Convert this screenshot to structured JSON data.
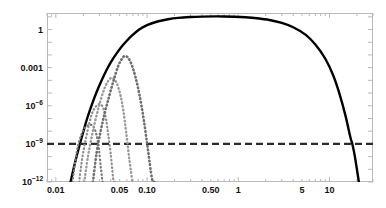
{
  "chart_data": {
    "type": "line",
    "title": "",
    "xlabel": "",
    "ylabel": "",
    "xscale": "log",
    "yscale": "log",
    "xlim": [
      0.008,
      30
    ],
    "ylim": [
      1e-12,
      20
    ],
    "grid": false,
    "legend": null,
    "xticks": [
      {
        "value": 0.01,
        "label": "0.01"
      },
      {
        "value": 0.05,
        "label": "0.05"
      },
      {
        "value": 0.1,
        "label": "0.10"
      },
      {
        "value": 0.5,
        "label": "0.50"
      },
      {
        "value": 1,
        "label": "1"
      },
      {
        "value": 5,
        "label": "5"
      },
      {
        "value": 10,
        "label": "10"
      }
    ],
    "yticks": [
      {
        "value": 1,
        "mantissa": "1",
        "exponent": ""
      },
      {
        "value": 0.001,
        "mantissa": "0.001",
        "exponent": ""
      },
      {
        "value": 1e-06,
        "mantissa": "10",
        "exponent": "−6"
      },
      {
        "value": 1e-09,
        "mantissa": "10",
        "exponent": "−9"
      },
      {
        "value": 1e-12,
        "mantissa": "10",
        "exponent": "−12"
      }
    ],
    "series": [
      {
        "name": "main-curve",
        "style": "solid",
        "color": "#000000",
        "width": 2.4,
        "points": [
          [
            0.0145,
            1e-12
          ],
          [
            0.016,
            2.2e-11
          ],
          [
            0.018,
            6e-10
          ],
          [
            0.02,
            9e-09
          ],
          [
            0.022,
            9.5e-08
          ],
          [
            0.025,
            1.4e-06
          ],
          [
            0.028,
            1.2e-05
          ],
          [
            0.032,
            0.00011
          ],
          [
            0.036,
            0.00065
          ],
          [
            0.04,
            0.0026
          ],
          [
            0.046,
            0.012
          ],
          [
            0.052,
            0.04
          ],
          [
            0.06,
            0.13
          ],
          [
            0.07,
            0.39
          ],
          [
            0.082,
            1.0
          ],
          [
            0.1,
            2.2
          ],
          [
            0.13,
            4.3
          ],
          [
            0.17,
            6.5
          ],
          [
            0.22,
            8.3
          ],
          [
            0.3,
            9.6
          ],
          [
            0.4,
            10.4
          ],
          [
            0.55,
            10.8
          ],
          [
            0.7,
            10.7
          ],
          [
            0.9,
            10.2
          ],
          [
            1.2,
            9.2
          ],
          [
            1.6,
            7.7
          ],
          [
            2.2,
            5.6
          ],
          [
            3.0,
            3.3
          ],
          [
            4.0,
            1.5
          ],
          [
            5.5,
            0.38
          ],
          [
            7.0,
            0.065
          ],
          [
            9.0,
            0.005
          ],
          [
            11.0,
            0.00024
          ],
          [
            13.0,
            7e-06
          ],
          [
            15.0,
            1.6e-07
          ],
          [
            17.0,
            3e-09
          ],
          [
            17.8,
            1e-09
          ],
          [
            19.0,
            1e-10
          ],
          [
            21.0,
            1e-12
          ]
        ]
      },
      {
        "name": "threshold-line",
        "style": "dashed",
        "color": "#2b2b2b",
        "width": 2.2,
        "constant_y": 1e-09
      },
      {
        "name": "dotted-curve-1",
        "style": "dotted",
        "color": "#7a7a7a",
        "width": 2.2,
        "peak_x": 0.024,
        "peak_y": 4e-09,
        "points": [
          [
            0.0152,
            1e-12
          ],
          [
            0.0163,
            4e-11
          ],
          [
            0.0175,
            7e-10
          ],
          [
            0.019,
            5e-09
          ],
          [
            0.0205,
            1.6e-08
          ],
          [
            0.022,
            2.6e-08
          ],
          [
            0.024,
            3.2e-08
          ],
          [
            0.0258,
            2.4e-08
          ],
          [
            0.0272,
            1e-08
          ],
          [
            0.0285,
            2.5e-09
          ],
          [
            0.0298,
            3e-10
          ],
          [
            0.0312,
            1.2e-11
          ],
          [
            0.0325,
            1e-12
          ]
        ]
      },
      {
        "name": "dotted-curve-2",
        "style": "dotted",
        "color": "#8d8d8d",
        "width": 2.2,
        "peak_x": 0.031,
        "peak_y": 1.3e-06,
        "points": [
          [
            0.018,
            1e-12
          ],
          [
            0.0195,
            8e-11
          ],
          [
            0.0212,
            2e-09
          ],
          [
            0.023,
            3e-08
          ],
          [
            0.025,
            2.6e-07
          ],
          [
            0.0272,
            8e-07
          ],
          [
            0.0295,
            1.3e-06
          ],
          [
            0.0315,
            1.2e-06
          ],
          [
            0.0335,
            5e-07
          ],
          [
            0.0355,
            9e-08
          ],
          [
            0.0375,
            6e-09
          ],
          [
            0.04,
            1.5e-10
          ],
          [
            0.0425,
            2e-12
          ],
          [
            0.044,
            1e-12
          ]
        ]
      },
      {
        "name": "dotted-curve-3",
        "style": "dotted",
        "color": "#9a9a9a",
        "width": 2.4,
        "peak_x": 0.041,
        "peak_y": 0.00015,
        "points": [
          [
            0.0205,
            1e-12
          ],
          [
            0.0225,
            1e-10
          ],
          [
            0.0248,
            4e-09
          ],
          [
            0.0272,
            8e-08
          ],
          [
            0.03,
            1.2e-06
          ],
          [
            0.033,
            1.2e-05
          ],
          [
            0.0362,
            6e-05
          ],
          [
            0.04,
            0.00015
          ],
          [
            0.0435,
            0.00013
          ],
          [
            0.047,
            5e-05
          ],
          [
            0.051,
            7e-06
          ],
          [
            0.055,
            4e-07
          ],
          [
            0.059,
            8e-09
          ],
          [
            0.064,
            6e-11
          ],
          [
            0.069,
            1e-12
          ]
        ]
      },
      {
        "name": "dotted-curve-4",
        "style": "dotted",
        "color": "#6f6f6f",
        "width": 2.6,
        "peak_x": 0.057,
        "peak_y": 0.008,
        "points": [
          [
            0.0255,
            1e-12
          ],
          [
            0.028,
            2e-10
          ],
          [
            0.031,
            1e-08
          ],
          [
            0.0345,
            3e-07
          ],
          [
            0.0385,
            6e-06
          ],
          [
            0.043,
            0.0001
          ],
          [
            0.048,
            0.0012
          ],
          [
            0.053,
            0.005
          ],
          [
            0.057,
            0.008
          ],
          [
            0.062,
            0.006
          ],
          [
            0.068,
            0.0016
          ],
          [
            0.075,
            0.00016
          ],
          [
            0.083,
            6e-06
          ],
          [
            0.092,
            8e-08
          ],
          [
            0.102,
            4e-10
          ],
          [
            0.113,
            2e-12
          ],
          [
            0.12,
            1e-12
          ]
        ]
      }
    ]
  }
}
